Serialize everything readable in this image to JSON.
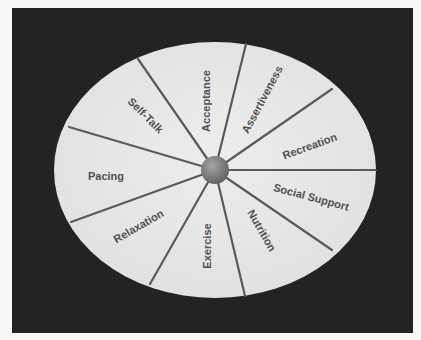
{
  "diagram": {
    "type": "wheel",
    "colors": {
      "page_background": "#f7f7f7",
      "panel_background": "#232323",
      "wheel_fill": "#e6e6e6",
      "spoke_color": "#5a5a5a",
      "hub_color": "#7a7a7a",
      "label_color": "#505050"
    },
    "segments": [
      {
        "label": "Acceptance",
        "x": 207,
        "y": 101,
        "rotate": -90
      },
      {
        "label": "Assertiveness",
        "x": 263,
        "y": 100,
        "rotate": -62
      },
      {
        "label": "Recreation",
        "x": 310,
        "y": 147,
        "rotate": -20
      },
      {
        "label": "Social Support",
        "x": 311,
        "y": 198,
        "rotate": 15
      },
      {
        "label": "Nutrition",
        "x": 261,
        "y": 231,
        "rotate": 60
      },
      {
        "label": "Exercise",
        "x": 208,
        "y": 246,
        "rotate": -90
      },
      {
        "label": "Relaxation",
        "x": 139,
        "y": 227,
        "rotate": -30
      },
      {
        "label": "Pacing",
        "x": 106,
        "y": 180,
        "rotate": 0
      },
      {
        "label": "Self-Talk",
        "x": 145,
        "y": 116,
        "rotate": 45
      }
    ],
    "hub": {
      "x": 215,
      "y": 170,
      "r": 14
    }
  }
}
